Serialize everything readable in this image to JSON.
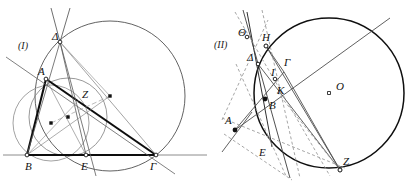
{
  "figure": {
    "type": "geometry-diagram",
    "panels": [
      {
        "tag": "(I)",
        "tag_pos": {
          "x": 18,
          "y": 49
        },
        "description": "Triangle ABΓ with circumcircle, incircle-like circles, cevians through Z and apex Δ",
        "points": [
          {
            "label": "Δ",
            "x": 60,
            "y": 42,
            "lx": 52,
            "ly": 40,
            "marker": "open"
          },
          {
            "label": "A",
            "x": 46,
            "y": 79,
            "lx": 38,
            "ly": 75,
            "marker": "open"
          },
          {
            "label": "Z",
            "x": 79,
            "y": 100,
            "lx": 82,
            "ly": 98,
            "marker": "none"
          },
          {
            "label": "B",
            "x": 27,
            "y": 155,
            "lx": 25,
            "ly": 170,
            "marker": "open"
          },
          {
            "label": "E",
            "x": 86,
            "y": 155,
            "lx": 81,
            "ly": 170,
            "marker": "open"
          },
          {
            "label": "Γ",
            "x": 156,
            "y": 155,
            "lx": 150,
            "ly": 170,
            "marker": "open"
          }
        ],
        "centers": [
          {
            "x": 110,
            "y": 96
          },
          {
            "x": 68,
            "y": 117
          },
          {
            "x": 51,
            "y": 123
          }
        ],
        "circles": [
          {
            "name": "circumcircle",
            "cx": 110,
            "cy": 96,
            "r": 75
          },
          {
            "name": "circle-mid-right",
            "cx": 68,
            "cy": 117,
            "r": 39
          },
          {
            "name": "circle-mid-left",
            "cx": 51,
            "cy": 123,
            "r": 38
          }
        ],
        "segments": [
          {
            "name": "base-line-BΓ",
            "x1": 3,
            "y1": 155,
            "x2": 207,
            "y2": 155,
            "weight": "thick"
          },
          {
            "name": "segment-A-Γ",
            "x1": 46,
            "y1": 79,
            "x2": 156,
            "y2": 155,
            "weight": "thick"
          },
          {
            "name": "segment-A-B",
            "x1": 46,
            "y1": 79,
            "x2": 27,
            "y2": 155,
            "weight": "thick"
          }
        ]
      },
      {
        "tag": "(II)",
        "tag_pos": {
          "x": 214,
          "y": 48
        },
        "description": "Circle with center O, chords and tangent construction through points Θ H Δ Γ I K B A E Z",
        "points": [
          {
            "label": "Θ",
            "x": 247,
            "y": 37,
            "lx": 238,
            "ly": 36,
            "marker": "open"
          },
          {
            "label": "H",
            "x": 266,
            "y": 46,
            "lx": 262,
            "ly": 41,
            "marker": "open"
          },
          {
            "label": "Δ",
            "x": 258,
            "y": 64,
            "lx": 248,
            "ly": 61,
            "marker": "open"
          },
          {
            "label": "Γ",
            "x": 284,
            "y": 72,
            "lx": 284,
            "ly": 66,
            "marker": "none"
          },
          {
            "label": "Ι",
            "x": 275,
            "y": 79,
            "lx": 272,
            "ly": 76,
            "marker": "open"
          },
          {
            "label": "Κ",
            "x": 277,
            "y": 92,
            "lx": 277,
            "ly": 93,
            "marker": "none"
          },
          {
            "label": "Β",
            "x": 265,
            "y": 99,
            "lx": 270,
            "ly": 108,
            "marker": "filled"
          },
          {
            "label": "Ο",
            "x": 329,
            "y": 93,
            "lx": 337,
            "ly": 90,
            "marker": "open"
          },
          {
            "label": "Α",
            "x": 235,
            "y": 130,
            "lx": 226,
            "ly": 124,
            "marker": "filled"
          },
          {
            "label": "Ε",
            "x": 272,
            "y": 147,
            "lx": 260,
            "ly": 155,
            "marker": "none"
          },
          {
            "label": "Ζ",
            "x": 340,
            "y": 170,
            "lx": 343,
            "ly": 165,
            "marker": "open"
          }
        ],
        "circles": [
          {
            "name": "main-circle",
            "cx": 329,
            "cy": 93,
            "r": 75
          }
        ]
      }
    ]
  }
}
